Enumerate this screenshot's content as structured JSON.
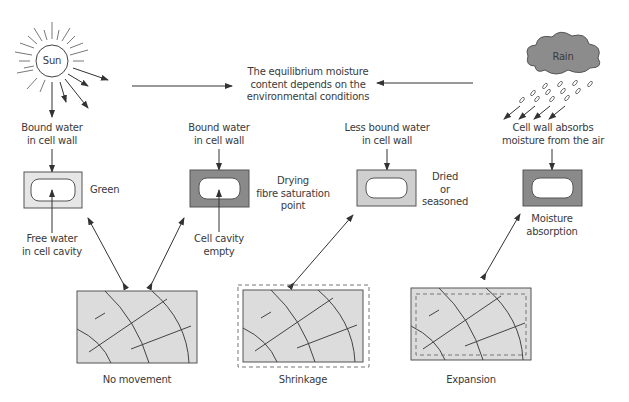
{
  "diagram": {
    "sun": {
      "label": "Sun"
    },
    "rain": {
      "label": "Rain"
    },
    "center_text": "The equilibrium moisture\ncontent depends on the\nenvironmental conditions",
    "stages": [
      {
        "top_label": "Bound water\nin cell wall",
        "side_label": "Green",
        "bottom_label": "Free water\nin cell cavity",
        "wall_color": "#e6e6e6",
        "wood_label": "No movement"
      },
      {
        "top_label": "Bound water\nin cell wall",
        "side_label": "Drying\nfibre saturation\npoint",
        "bottom_label": "Cell cavity\nempty",
        "wall_color": "#8a8a8a",
        "wood_label": "Shrinkage"
      },
      {
        "top_label": "Less bound water\nin cell wall",
        "side_label": "Dried\nor\nseasoned",
        "wall_color": "#cfcfcf",
        "wood_label": "Expansion"
      },
      {
        "top_label": "Cell wall absorbs\nmoisture from the air",
        "side_label": "Moisture\nabsorption",
        "wall_color": "#8a8a8a"
      }
    ]
  }
}
